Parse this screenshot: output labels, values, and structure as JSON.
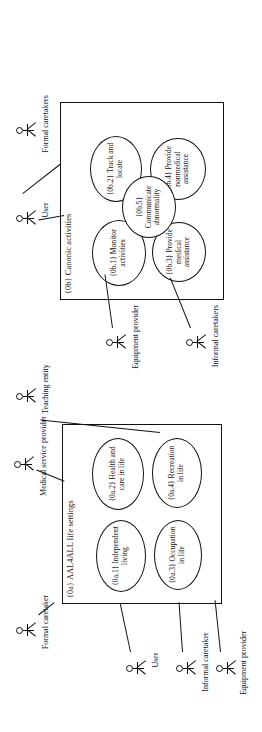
{
  "diagram": {
    "type": "uml-use-case-diagram",
    "orientation": "rotated-90-ccw",
    "packages": [
      {
        "id": "0b",
        "title": "{0b} Canonic activities",
        "use_cases": [
          {
            "id": "0b.1",
            "label": "{0b.1} Monitor activities"
          },
          {
            "id": "0b.2",
            "label": "{0b.2} Track and locate"
          },
          {
            "id": "0b.3",
            "label": "{0b.3} Provide medical assistance"
          },
          {
            "id": "0b.4",
            "label": "{0b.4} Provide nonmedical assistance"
          },
          {
            "id": "0b.5",
            "label": "{0b.5} Communicate abnormality"
          }
        ],
        "actors": [
          {
            "id": "user-b",
            "label": "User"
          },
          {
            "id": "formal-caretakers",
            "label": "Formal caretakers"
          },
          {
            "id": "equipment-provider-b",
            "label": "Equipment provider"
          },
          {
            "id": "informal-caretakers",
            "label": "Informal caretakers"
          }
        ]
      },
      {
        "id": "0a",
        "title": "{0a} AAL4ALL life settings",
        "use_cases": [
          {
            "id": "0a.1",
            "label": "{0a.1} Independent living"
          },
          {
            "id": "0a.2",
            "label": "{0a.2} Health and care in life"
          },
          {
            "id": "0a.3",
            "label": "{0a.3} Occupation in life"
          },
          {
            "id": "0a.4",
            "label": "{0a.4} Recreation in life"
          }
        ],
        "actors": [
          {
            "id": "medical-service-provider",
            "label": "Medical service provider"
          },
          {
            "id": "teaching-entity",
            "label": "Teaching entity"
          },
          {
            "id": "formal-caretaker",
            "label": "Formal caretaker"
          },
          {
            "id": "user-a",
            "label": "User"
          },
          {
            "id": "informal-caretaker",
            "label": "Informal caretaker"
          },
          {
            "id": "equipment-provider-a",
            "label": "Equipment provider"
          }
        ]
      }
    ]
  }
}
